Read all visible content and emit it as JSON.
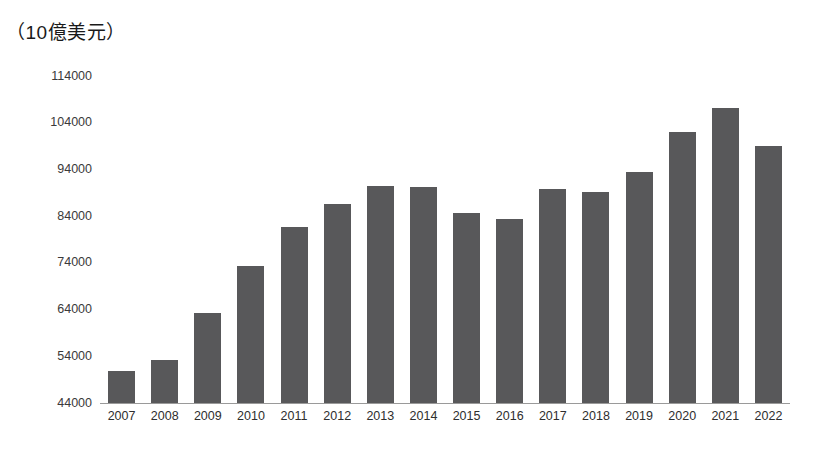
{
  "chart_data": {
    "type": "bar",
    "title": "（10億美元）",
    "xlabel": "",
    "ylabel": "",
    "ylim": [
      44000,
      114000
    ],
    "y_ticks": [
      44000,
      54000,
      64000,
      74000,
      84000,
      94000,
      104000,
      114000
    ],
    "y_tick_labels": [
      "44000",
      "54000",
      "64000",
      "74000",
      "84000",
      "94000",
      "104000",
      "114000"
    ],
    "grid": false,
    "legend": null,
    "bar_color": "#58585a",
    "categories": [
      "2007",
      "2008",
      "2009",
      "2010",
      "2011",
      "2012",
      "2013",
      "2014",
      "2015",
      "2016",
      "2017",
      "2018",
      "2019",
      "2020",
      "2021",
      "2022"
    ],
    "values": [
      50900,
      53300,
      63200,
      73300,
      81700,
      86600,
      90500,
      90300,
      84700,
      83400,
      89900,
      89200,
      93500,
      102100,
      107100,
      99100
    ]
  }
}
